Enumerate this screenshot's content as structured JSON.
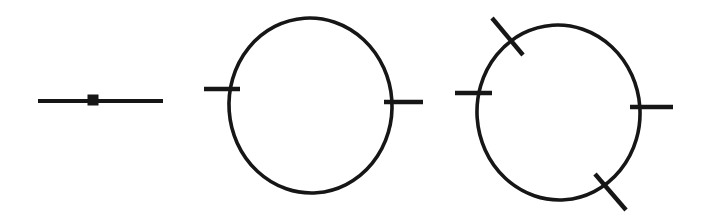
{
  "figure": {
    "background_color": "#ffffff",
    "ink_color": "#161616",
    "canvas": {
      "width": 704,
      "height": 218
    },
    "panel_count": 3,
    "panels": [
      {
        "id": "panel-1",
        "name": "tree-level-propagator",
        "description": "straight horizontal propagator line with a filled square vertex at its midpoint",
        "line": {
          "x1": 38,
          "y1": 101,
          "x2": 163,
          "y2": 101,
          "stroke_width": 4.2
        },
        "vertex": {
          "shape": "square",
          "cx": 93,
          "cy": 100,
          "size": 11
        },
        "tick_count": 0
      },
      {
        "id": "panel-2",
        "name": "one-loop-two-vertex",
        "description": "closed loop (ellipse) with two horizontal external legs, upper-left and lower-right",
        "loop": {
          "cx": 310.5,
          "cy": 105.5,
          "rx": 81.5,
          "ry": 87.5,
          "stroke_width": 3.6,
          "rotation": -4
        },
        "legs": [
          {
            "name": "leg-left-horizontal",
            "x1": 204,
            "y1": 89,
            "x2": 240,
            "y2": 89,
            "stroke_width": 4.4,
            "angle_deg": 0
          },
          {
            "name": "leg-right-horizontal",
            "x1": 384,
            "y1": 102,
            "x2": 423,
            "y2": 102,
            "stroke_width": 4.4,
            "angle_deg": 0
          }
        ],
        "tick_count": 2
      },
      {
        "id": "panel-3",
        "name": "one-loop-four-vertex",
        "description": "closed loop (ellipse) with four external legs: two horizontal (left, right) and two diagonal (upper-left, lower-right)",
        "loop": {
          "cx": 558.5,
          "cy": 112.5,
          "rx": 81.5,
          "ry": 87.5,
          "stroke_width": 3.6,
          "rotation": -4
        },
        "legs": [
          {
            "name": "leg-upper-left-diagonal",
            "x1": 492,
            "y1": 18,
            "x2": 523,
            "y2": 55,
            "stroke_width": 4.4,
            "angle_deg": 50
          },
          {
            "name": "leg-left-horizontal",
            "x1": 455,
            "y1": 93,
            "x2": 492,
            "y2": 93,
            "stroke_width": 4.4,
            "angle_deg": 0
          },
          {
            "name": "leg-right-horizontal",
            "x1": 630,
            "y1": 107,
            "x2": 673,
            "y2": 107,
            "stroke_width": 4.4,
            "angle_deg": 0
          },
          {
            "name": "leg-lower-right-diagonal",
            "x1": 595,
            "y1": 174,
            "x2": 626,
            "y2": 210,
            "stroke_width": 4.4,
            "angle_deg": 49
          }
        ],
        "tick_count": 4
      }
    ]
  }
}
